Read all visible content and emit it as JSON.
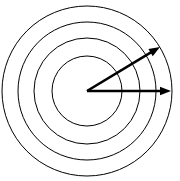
{
  "figure": {
    "background_color": "#ffffff",
    "stroke_color": "#000000",
    "width": 180,
    "height": 181
  },
  "chart_data": {
    "type": "scatter",
    "subtitle": "",
    "xlabel": "",
    "ylabel": "",
    "grid": false,
    "legend": "none",
    "xlim": [
      0,
      180
    ],
    "ylim": [
      0,
      181
    ],
    "center": {
      "x": 87,
      "y": 91
    },
    "circles": [
      {
        "name": "innermost-circle",
        "index": 1,
        "radius": 35,
        "fill": "#ffffff",
        "stroke": "#000000",
        "stroke_width": 1
      },
      {
        "name": "second-circle",
        "index": 2,
        "radius": 53,
        "fill": "none",
        "stroke": "#000000",
        "stroke_width": 1
      },
      {
        "name": "third-circle",
        "index": 3,
        "radius": 69,
        "fill": "none",
        "stroke": "#000000",
        "stroke_width": 1
      },
      {
        "name": "outermost-circle",
        "index": 4,
        "radius": 85,
        "fill": "none",
        "stroke": "#000000",
        "stroke_width": 1
      }
    ],
    "rays": [
      {
        "name": "horizontal-ray",
        "from": {
          "x": 87,
          "y": 91
        },
        "to": {
          "x": 171,
          "y": 91
        },
        "angle_degrees": 0,
        "length": 84,
        "stroke": "#000000",
        "stroke_width": 2.6,
        "arrowhead": "filled-triangle"
      },
      {
        "name": "diagonal-ray",
        "from": {
          "x": 87,
          "y": 91
        },
        "to": {
          "x": 160,
          "y": 47
        },
        "angle_degrees": 31,
        "length": 85,
        "stroke": "#000000",
        "stroke_width": 2.6,
        "arrowhead": "filled-triangle"
      }
    ],
    "angle_between_rays_degrees": 31,
    "labels": [],
    "annotations": []
  }
}
